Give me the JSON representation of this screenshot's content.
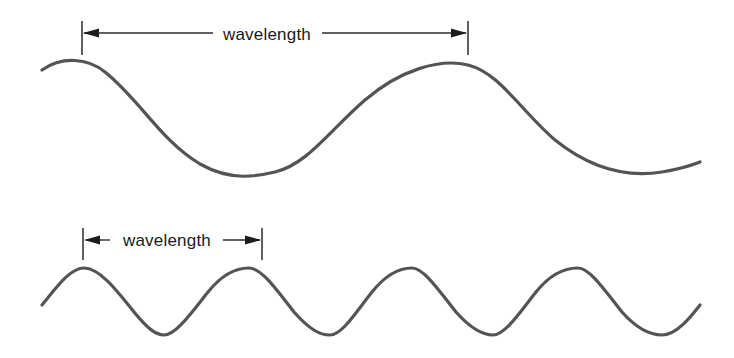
{
  "figure": {
    "title_visible": false,
    "background_color": "#ffffff",
    "wave_stroke_color": "#545454",
    "annotation_color": "#1c1c1c"
  },
  "annotations": {
    "top": {
      "label": "wavelength",
      "label_x": 267,
      "label_y": 40,
      "left_tick_x": 82,
      "right_tick_x": 468,
      "line_y": 33,
      "tick_top_y": 21,
      "tick_bottom_y": 55,
      "arrow_direction": "inward"
    },
    "bottom": {
      "label": "wavelength",
      "label_x": 167,
      "label_y": 246,
      "left_tick_x": 83,
      "right_tick_x": 262,
      "line_y": 240,
      "tick_top_y": 228,
      "tick_bottom_y": 260,
      "arrow_direction": "outward"
    }
  },
  "chart_data": {
    "type": "line",
    "title": "",
    "xlabel": "",
    "ylabel": "",
    "grid": false,
    "legend_position": "none",
    "annotations": [
      "wavelength",
      "wavelength"
    ],
    "series": [
      {
        "name": "long-wavelength-wave",
        "wavelength_px": 386,
        "amplitude_px": 53,
        "midline_y": 118,
        "crest_y": 65,
        "trough_y": 172,
        "x_start": 42,
        "x_end": 700,
        "crest_x": [
          82,
          468
        ],
        "trough_x": [
          275,
          662
        ],
        "path": "M42,70 C62,56 88,58 105,72 C140,100 160,140 200,164 C232,182 258,176 275,172 C308,164 330,130 365,100 C400,70 440,58 468,65 C500,73 520,110 555,140 C590,168 625,178 662,172 C680,169 690,166 700,162"
      },
      {
        "name": "short-wavelength-wave",
        "wavelength_px": 166,
        "amplitude_px": 33,
        "midline_y": 301,
        "crest_y": 268,
        "trough_y": 335,
        "x_start": 42,
        "x_end": 700,
        "crest_x": [
          84,
          249,
          412,
          578
        ],
        "trough_x": [
          164,
          330,
          493,
          662
        ],
        "path": "M42,305 C56,288 70,268 84,268 C100,268 118,292 134,312 C148,329 156,335 164,335 C176,335 192,312 208,292 C224,272 238,268 249,268 C262,268 278,292 294,312 C310,330 320,335 330,335 C342,335 356,312 372,292 C388,272 402,268 412,268 C424,268 440,292 456,312 C472,330 483,335 493,335 C505,335 520,312 536,292 C552,272 568,268 578,268 C590,268 606,292 622,312 C638,330 652,335 662,335 C676,335 690,318 700,305"
      }
    ]
  }
}
